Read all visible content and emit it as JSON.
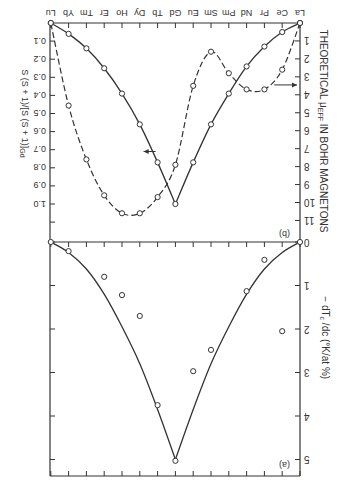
{
  "figure": {
    "rotation_deg": 180,
    "ink_color": "#333333",
    "background": "#ffffff"
  },
  "chart_data": [
    {
      "type": "line",
      "panel_label": "(b)",
      "title": "",
      "xlabel": "",
      "categories": [
        "La",
        "Ce",
        "Pr",
        "Nd",
        "Pm",
        "Sm",
        "Eu",
        "Gd",
        "Tb",
        "Dy",
        "Ho",
        "Er",
        "Tm",
        "Yb",
        "Lu"
      ],
      "y_right_label": "THEORETICAL μEFF IN BOHR MAGNETONS",
      "y_right_ticks": [
        "1",
        "2",
        "3",
        "4",
        "5",
        "6",
        "7",
        "8",
        "9",
        "10",
        "11"
      ],
      "y_right_range": [
        0,
        11
      ],
      "y_left_label": "S (S + 1)/[S (S + 1)]Gd",
      "y_left_ticks": [
        "0.1",
        "0.2",
        "0.3",
        "0.4",
        "0.5",
        "0.6",
        "0.7",
        "0.8",
        "0.9",
        "1.0"
      ],
      "y_left_range": [
        0,
        1.1
      ],
      "series": [
        {
          "name": "S(S+1)/[S(S+1)]Gd",
          "style": "solid",
          "axis": "left",
          "values": [
            0,
            0.05,
            0.13,
            0.24,
            0.39,
            0.56,
            0.77,
            1.0,
            0.77,
            0.56,
            0.39,
            0.25,
            0.14,
            0.06,
            0
          ]
        },
        {
          "name": "Theoretical μeff",
          "style": "dashed",
          "axis": "right",
          "values": [
            0,
            2.6,
            3.7,
            3.7,
            2.8,
            1.6,
            3.5,
            7.9,
            9.7,
            10.6,
            10.6,
            9.6,
            7.6,
            4.6,
            0
          ]
        }
      ],
      "grid": false
    },
    {
      "type": "line",
      "panel_label": "(a)",
      "title": "",
      "xlabel": "",
      "categories": [
        "La",
        "Ce",
        "Pr",
        "Nd",
        "Pm",
        "Sm",
        "Eu",
        "Gd",
        "Tb",
        "Dy",
        "Ho",
        "Er",
        "Tm",
        "Yb",
        "Lu"
      ],
      "y_right_label": "−dTc/dc (°K/at %)",
      "y_right_ticks": [
        "0",
        "1",
        "2",
        "3",
        "4",
        "5"
      ],
      "y_right_range": [
        0,
        5.4
      ],
      "series": [
        {
          "name": "measured −dTc/dc",
          "style": "markers",
          "points": [
            {
              "x": "La",
              "y": 0
            },
            {
              "x": "Ce",
              "y": 2.05
            },
            {
              "x": "Pr",
              "y": 0.41
            },
            {
              "x": "Nd",
              "y": 1.13
            },
            {
              "x": "Sm",
              "y": 2.48
            },
            {
              "x": "Eu",
              "y": 2.97
            },
            {
              "x": "Gd",
              "y": 5.03
            },
            {
              "x": "Tb",
              "y": 3.75
            },
            {
              "x": "Dy",
              "y": 1.7
            },
            {
              "x": "Ho",
              "y": 1.22
            },
            {
              "x": "Er",
              "y": 0.8
            },
            {
              "x": "Yb",
              "y": 0.21
            },
            {
              "x": "Lu",
              "y": 0
            }
          ]
        },
        {
          "name": "fit curve (∝ de Gennes factor)",
          "style": "solid",
          "values": [
            0,
            0.24,
            0.62,
            1.2,
            1.95,
            2.8,
            3.85,
            5.0,
            3.85,
            2.8,
            1.95,
            1.2,
            0.62,
            0.24,
            0
          ]
        }
      ],
      "grid": false
    }
  ],
  "labels": {
    "panel_b": "(b)",
    "panel_a": "(a)",
    "right_title_b": "THEORETICAL μ",
    "right_title_b_sub": "EFF",
    "right_title_b_tail": " IN BOHR MAGNETONS",
    "right_title_a": "− dT",
    "right_title_a_sub": "c",
    "right_title_a_tail": " /dc (°K/at %)",
    "left_title_b": "S (S + 1)/[S (S + 1)]",
    "left_title_b_sub": "Gd"
  }
}
